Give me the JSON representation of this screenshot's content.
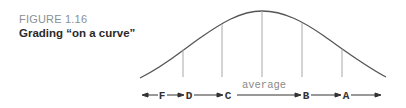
{
  "caption": {
    "figure_number": "FIGURE 1.16",
    "title": "Grading “on a curve”"
  },
  "diagram": {
    "center_label": "average",
    "grades": [
      "F",
      "D",
      "C",
      "B",
      "A"
    ],
    "colors": {
      "curve": "#555555",
      "divider": "#a8a8a8",
      "arrow": "#333333",
      "average_label": "#8a8a8a"
    }
  }
}
